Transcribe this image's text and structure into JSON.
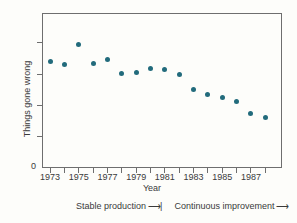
{
  "figure": {
    "background": "#fdfdfa",
    "axis_color": "#6e6e6e",
    "text_color": "#3a3a3a"
  },
  "chart_data": {
    "type": "scatter",
    "title": "",
    "xlabel": "Year",
    "ylabel": "Things gone wrong",
    "origin_label": "0",
    "x": [
      1973,
      1974,
      1975,
      1976,
      1977,
      1978,
      1979,
      1980,
      1981,
      1982,
      1983,
      1984,
      1985,
      1986,
      1987,
      1988
    ],
    "values": [
      3.39,
      3.3,
      3.96,
      3.34,
      3.47,
      3.02,
      3.06,
      3.18,
      3.16,
      3.0,
      2.51,
      2.35,
      2.24,
      2.11,
      1.74,
      1.61
    ],
    "xtick_labeled_years": [
      "1973",
      "1975",
      "1977",
      "1979",
      "1981",
      "1983",
      "1985",
      "1987"
    ],
    "yticks": [
      1,
      2,
      3,
      4
    ],
    "xlim": [
      1972.44,
      1989.16
    ],
    "ylim": [
      0,
      4.95
    ],
    "grid": false,
    "legend": "none",
    "point_color": "#226b7c",
    "annotations": [
      {
        "label": "Stable production",
        "arrow_icon": "⟶|"
      },
      {
        "label": "Continuous improvement",
        "arrow_icon": "⟶"
      }
    ]
  }
}
